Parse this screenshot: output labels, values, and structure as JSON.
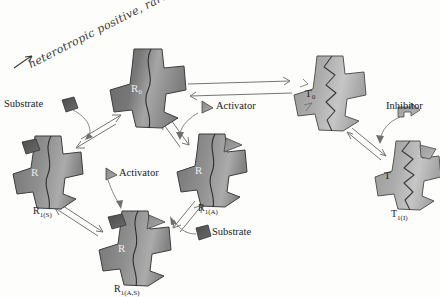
{
  "figure": {
    "type": "biochemistry-allosteric-model-diagram",
    "background_color": "#fdfdfc",
    "ink_color": "#1a1a1a"
  },
  "annotation": {
    "handwritten_note": "heterotropic positive, rare",
    "arrow_glyph": "→",
    "color": "#3a3a3a"
  },
  "palette": {
    "r_state_fill_dark": "#6f6f6f",
    "r_state_fill_light": "#a9a9a9",
    "t_state_fill_dark": "#9b9b9b",
    "t_state_fill_light": "#c9c9c9",
    "substrate_fill": "#555555",
    "activator_fill": "#8c8c8c",
    "inhibitor_fill": "#9a9a9a",
    "outline": "#3d3d3d",
    "arrow_stroke": "#6a6a6a"
  },
  "states": [
    {
      "id": "R0",
      "label": "R",
      "sub": "0",
      "inner_label": "R₀",
      "conformation": "R",
      "x": 148,
      "y": 88,
      "size": 78,
      "seam": "wavy",
      "label_x": 148,
      "label_y": 135,
      "show_caption": false
    },
    {
      "id": "R1S",
      "label": "R",
      "sub": "1(S)",
      "inner_label": "R",
      "conformation": "R",
      "x": 48,
      "y": 172,
      "size": 72,
      "seam": "wavy",
      "label_x": 48,
      "label_y": 207,
      "show_caption": true
    },
    {
      "id": "R1A",
      "label": "R",
      "sub": "1(A)",
      "inner_label": "R",
      "conformation": "R",
      "x": 212,
      "y": 170,
      "size": 72,
      "seam": "wavy",
      "label_x": 214,
      "label_y": 205,
      "show_caption": true
    },
    {
      "id": "R1AS",
      "label": "R",
      "sub": "1(A,S)",
      "inner_label": "R",
      "conformation": "R",
      "x": 135,
      "y": 248,
      "size": 74,
      "seam": "wavy",
      "label_x": 135,
      "label_y": 286,
      "show_caption": true
    },
    {
      "id": "T0",
      "label": "T",
      "sub": "0",
      "inner_label": "T₀",
      "conformation": "T",
      "x": 330,
      "y": 93,
      "size": 74,
      "seam": "jagged",
      "label_x": 330,
      "label_y": 133,
      "show_caption": false
    },
    {
      "id": "T1I",
      "label": "T",
      "sub": "1(I)",
      "inner_label": "T",
      "conformation": "T",
      "x": 408,
      "y": 175,
      "size": 68,
      "seam": "jagged",
      "label_x": 406,
      "label_y": 211,
      "show_caption": true
    }
  ],
  "state_captions": [
    {
      "for": "R1S",
      "text": "R",
      "sub": "1(S)"
    },
    {
      "for": "R1A",
      "text": "R",
      "sub": "1(A)"
    },
    {
      "for": "R1AS",
      "text": "R",
      "sub": "1(A,S)"
    },
    {
      "for": "T1I",
      "text": "T",
      "sub": "1(I)"
    }
  ],
  "ligand_labels": [
    {
      "id": "substrate-top-left",
      "text": "Substrate",
      "x": 4,
      "y": 99
    },
    {
      "id": "activator-top-right",
      "text": "Activator",
      "x": 211,
      "y": 101
    },
    {
      "id": "activator-center",
      "text": "Activator",
      "x": 114,
      "y": 167
    },
    {
      "id": "substrate-bottom-right",
      "text": "Substrate",
      "x": 209,
      "y": 225
    },
    {
      "id": "inhibitor-right",
      "text": "Inhibitor",
      "x": 386,
      "y": 101
    }
  ],
  "bound_ligands": [
    {
      "state": "R1S",
      "ligand": "substrate",
      "shape": "pentagon"
    },
    {
      "state": "R1A",
      "ligand": "activator",
      "shape": "triangle"
    },
    {
      "state": "R1AS",
      "ligand": "substrate",
      "shape": "pentagon"
    },
    {
      "state": "R1AS",
      "ligand": "activator",
      "shape": "triangle"
    },
    {
      "state": "T1I",
      "ligand": "inhibitor",
      "shape": "flag"
    }
  ],
  "free_ligands": [
    {
      "id": "substrate-icon-tl",
      "shape": "pentagon",
      "x": 62,
      "y": 104
    },
    {
      "id": "activator-icon-tr",
      "shape": "triangle",
      "x": 201,
      "y": 108
    },
    {
      "id": "activator-icon-mid",
      "shape": "triangle",
      "x": 105,
      "y": 174
    },
    {
      "id": "substrate-icon-br",
      "shape": "pentagon",
      "x": 198,
      "y": 230
    },
    {
      "id": "inhibitor-icon-r",
      "shape": "flag",
      "x": 404,
      "y": 112
    }
  ],
  "equilibrium_arrows": [
    {
      "id": "R0-T0",
      "from": "R0",
      "to": "T0",
      "style": "open-double-headed"
    },
    {
      "id": "R0-R1S",
      "from": "R0",
      "to": "R1S",
      "style": "open-double-headed"
    },
    {
      "id": "R0-R1A",
      "from": "R0",
      "to": "R1A",
      "style": "open-double-headed"
    },
    {
      "id": "R1S-R1AS",
      "from": "R1S",
      "to": "R1AS",
      "style": "open-double-headed"
    },
    {
      "id": "R1A-R1AS",
      "from": "R1A",
      "to": "R1AS",
      "style": "open-double-headed"
    },
    {
      "id": "T0-T1I",
      "from": "T0",
      "to": "T1I",
      "style": "open-double-headed"
    }
  ],
  "binding_arrows": [
    {
      "id": "substrate-to-R1S",
      "ligand": "substrate",
      "target": "R1S"
    },
    {
      "id": "activator-to-R1A",
      "ligand": "activator",
      "target": "R1A"
    },
    {
      "id": "activator-to-R1AS",
      "ligand": "activator",
      "target": "R1AS"
    },
    {
      "id": "substrate-to-R1AS",
      "ligand": "substrate",
      "target": "R1AS"
    },
    {
      "id": "inhibitor-to-T1I",
      "ligand": "inhibitor",
      "target": "T1I"
    }
  ]
}
